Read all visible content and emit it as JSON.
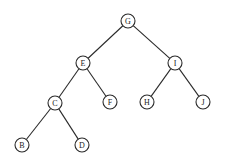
{
  "diagram": {
    "type": "binary-tree",
    "nodes": [
      {
        "id": "G",
        "label": "G",
        "x": 128,
        "y": 21
      },
      {
        "id": "E",
        "label": "E",
        "x": 83,
        "y": 63
      },
      {
        "id": "I",
        "label": "I",
        "x": 175,
        "y": 63
      },
      {
        "id": "C",
        "label": "C",
        "x": 55,
        "y": 103
      },
      {
        "id": "F",
        "label": "F",
        "x": 110,
        "y": 102
      },
      {
        "id": "H",
        "label": "H",
        "x": 147,
        "y": 102
      },
      {
        "id": "J",
        "label": "J",
        "x": 203,
        "y": 102
      },
      {
        "id": "B",
        "label": "B",
        "x": 22,
        "y": 145
      },
      {
        "id": "D",
        "label": "D",
        "x": 82,
        "y": 145
      }
    ],
    "edges": [
      [
        "G",
        "E"
      ],
      [
        "G",
        "I"
      ],
      [
        "E",
        "C"
      ],
      [
        "E",
        "F"
      ],
      [
        "I",
        "H"
      ],
      [
        "I",
        "J"
      ],
      [
        "C",
        "B"
      ],
      [
        "C",
        "D"
      ]
    ],
    "node_radius": 7,
    "colors": {
      "stroke": "#2a2a2a",
      "fill": "#ffffff",
      "background": "#ffffff"
    }
  }
}
